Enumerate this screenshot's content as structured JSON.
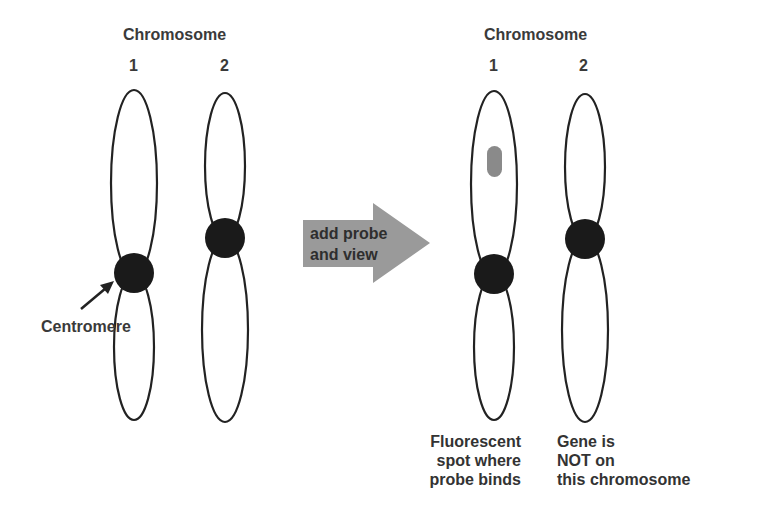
{
  "left_panel": {
    "title": "Chromosome",
    "chromosome_1_label": "1",
    "chromosome_2_label": "2",
    "centromere_label": "Centromere"
  },
  "arrow": {
    "line1": "add probe",
    "line2": "and view",
    "fill_color": "#9a9a9a"
  },
  "right_panel": {
    "title": "Chromosome",
    "chromosome_1_label": "1",
    "chromosome_2_label": "2",
    "caption_1": [
      "Fluorescent",
      "spot where",
      "probe binds"
    ],
    "caption_2": [
      "Gene is",
      "NOT on",
      "this chromosome"
    ]
  },
  "colors": {
    "outline": "#222222",
    "centromere": "#1a1a1a",
    "probe_spot": "#8a8a8a"
  }
}
